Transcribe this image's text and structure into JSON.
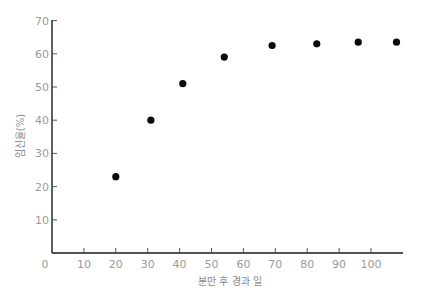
{
  "chart_data": {
    "type": "scatter",
    "title": "",
    "xlabel": "분만 후 경과 일",
    "ylabel": "임신율(%)",
    "xlim": [
      0,
      110
    ],
    "ylim": [
      0,
      70
    ],
    "grid": false,
    "legend": null,
    "x_ticks": [
      0,
      10,
      20,
      30,
      40,
      50,
      60,
      70,
      80,
      90,
      100
    ],
    "y_ticks": [
      10,
      20,
      30,
      40,
      50,
      60,
      70
    ],
    "x": [
      20,
      31,
      41,
      54,
      69,
      83,
      96,
      108
    ],
    "y": [
      23,
      40,
      51,
      59,
      62.5,
      63,
      63.5,
      63.5
    ],
    "series": [
      {
        "name": "임신율",
        "points": [
          {
            "x": 20,
            "y": 23
          },
          {
            "x": 31,
            "y": 40
          },
          {
            "x": 41,
            "y": 51
          },
          {
            "x": 54,
            "y": 59
          },
          {
            "x": 69,
            "y": 62.5
          },
          {
            "x": 83,
            "y": 63
          },
          {
            "x": 96,
            "y": 63.5
          },
          {
            "x": 108,
            "y": 63.5
          }
        ]
      }
    ]
  },
  "layout": {
    "origin_px": [
      52,
      253
    ],
    "x_px_per_unit": 3.19,
    "y_px_per_unit": 3.32,
    "x_axis_end_px": 403,
    "y_axis_top_px": 20
  },
  "colors": {
    "point": "#0a0a0a",
    "axis": "#1a1a1a",
    "label": "#9a9a9a"
  }
}
